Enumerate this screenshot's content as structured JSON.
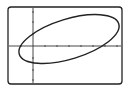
{
  "diagram": {
    "type": "graphing-calculator-window",
    "frame": {
      "x": 8,
      "y": 7,
      "width": 114,
      "height": 77,
      "corner_radius": 3,
      "stroke": "#222222"
    },
    "axes": {
      "origin": {
        "x": 33,
        "y": 46
      },
      "x_axis": {
        "from": 9,
        "to": 121,
        "ticks": [
          21,
          45,
          57,
          69,
          81,
          93,
          105,
          117
        ]
      },
      "y_axis": {
        "from": 8,
        "to": 83,
        "ticks": [
          12,
          22,
          34,
          58,
          70,
          80
        ]
      },
      "stroke": "#333333"
    },
    "curve": {
      "shape": "ellipse",
      "center": {
        "x": 69,
        "y": 39
      },
      "rx": 52,
      "ry": 20,
      "rotation_deg": -17,
      "stroke": "#222222"
    }
  }
}
